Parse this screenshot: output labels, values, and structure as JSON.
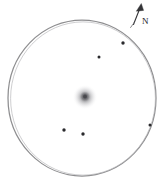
{
  "sketch": {
    "kind": "astronomical-eyepiece-field-sketch",
    "background_color": "#ffffff",
    "canvas": {
      "width": 166,
      "height": 191
    },
    "field_of_view_circle": {
      "name": "eyepiece-field-of-view",
      "center_x": 82,
      "center_y": 98,
      "radius_x": 74,
      "radius_y": 78,
      "stroke_color": "#8e8e90",
      "stroke_width": 1.25
    },
    "deep_sky_object": {
      "label": "diffuse-nebulous-object",
      "center_x": 85,
      "center_y": 97,
      "radius": 11,
      "core_radius": 4,
      "core_color": "#6b6b6e",
      "halo_color": "#bdbdc0"
    },
    "stars": [
      {
        "id": "star-1",
        "x": 123,
        "y": 43,
        "radius": 1.6,
        "color": "#2a2a2d"
      },
      {
        "id": "star-2",
        "x": 99,
        "y": 57,
        "radius": 1.5,
        "color": "#2a2a2d"
      },
      {
        "id": "star-3",
        "x": 150,
        "y": 125,
        "radius": 1.5,
        "color": "#2a2a2d"
      },
      {
        "id": "star-4",
        "x": 64,
        "y": 130,
        "radius": 1.6,
        "color": "#2a2a2d"
      },
      {
        "id": "star-5",
        "x": 83,
        "y": 134,
        "radius": 1.6,
        "color": "#2a2a2d"
      }
    ],
    "direction_indicator": {
      "name": "north-arrow",
      "label": "N",
      "label_x": 143,
      "label_y": 23,
      "shaft_start_x": 133,
      "shaft_start_y": 25,
      "shaft_end_x": 140,
      "shaft_end_y": 7,
      "color": "#343437"
    }
  }
}
